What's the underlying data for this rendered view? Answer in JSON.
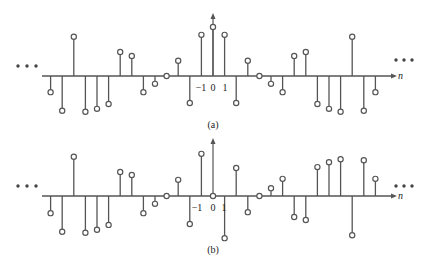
{
  "figure": {
    "panels": [
      {
        "id": "a",
        "caption": "(a)",
        "axis_label": "n",
        "tick_labels": [
          {
            "n": -1,
            "text": "−1"
          },
          {
            "n": 0,
            "text": "0"
          },
          {
            "n": 1,
            "text": "1"
          }
        ],
        "ellipsis": "• • •"
      },
      {
        "id": "b",
        "caption": "(b)",
        "axis_label": "n",
        "tick_labels": [
          {
            "n": -1,
            "text": "−1"
          },
          {
            "n": 0,
            "text": "0"
          },
          {
            "n": 1,
            "text": "1"
          }
        ],
        "ellipsis": "• • •"
      }
    ],
    "colors": {
      "stem": "#555555",
      "axis": "#555555",
      "marker_fill": "#ffffff",
      "text": "#222222"
    }
  },
  "chart_data": [
    {
      "type": "stem",
      "title": "(a)",
      "xlabel": "n",
      "ylabel": "",
      "symmetry": "even",
      "x": [
        -14,
        -13,
        -12,
        -11,
        -10,
        -9,
        -8,
        -7,
        -6,
        -5,
        -4,
        -3,
        -2,
        -1,
        0,
        1,
        2,
        3,
        4,
        5,
        6,
        7,
        8,
        9,
        10,
        11,
        12,
        13,
        14
      ],
      "values": [
        -0.33,
        -0.71,
        0.8,
        -0.73,
        -0.67,
        -0.57,
        0.49,
        0.41,
        -0.33,
        -0.16,
        0.0,
        0.31,
        -0.55,
        0.84,
        1.0,
        0.84,
        -0.55,
        0.31,
        0.0,
        -0.16,
        -0.33,
        0.41,
        0.49,
        -0.57,
        -0.67,
        -0.73,
        0.8,
        -0.71,
        -0.33
      ],
      "x_tick_labels": [
        "-1",
        "0",
        "1"
      ],
      "continues": "both directions (ellipsis)",
      "grid": false
    },
    {
      "type": "stem",
      "title": "(b)",
      "xlabel": "n",
      "ylabel": "",
      "symmetry": "odd",
      "x": [
        -14,
        -13,
        -12,
        -11,
        -10,
        -9,
        -8,
        -7,
        -6,
        -5,
        -4,
        -3,
        -2,
        -1,
        0,
        1,
        2,
        3,
        4,
        5,
        6,
        7,
        8,
        9,
        10,
        11,
        12,
        13,
        14
      ],
      "values": [
        -0.35,
        -0.73,
        0.8,
        -0.75,
        -0.69,
        -0.59,
        0.49,
        0.43,
        -0.35,
        -0.16,
        0.0,
        0.33,
        -0.57,
        0.86,
        0.0,
        -0.86,
        0.57,
        -0.33,
        0.0,
        0.16,
        0.35,
        -0.43,
        -0.49,
        0.59,
        0.69,
        0.75,
        -0.8,
        0.73,
        0.35
      ],
      "x_tick_labels": [
        "-1",
        "0",
        "1"
      ],
      "continues": "both directions (ellipsis)",
      "grid": false
    }
  ]
}
